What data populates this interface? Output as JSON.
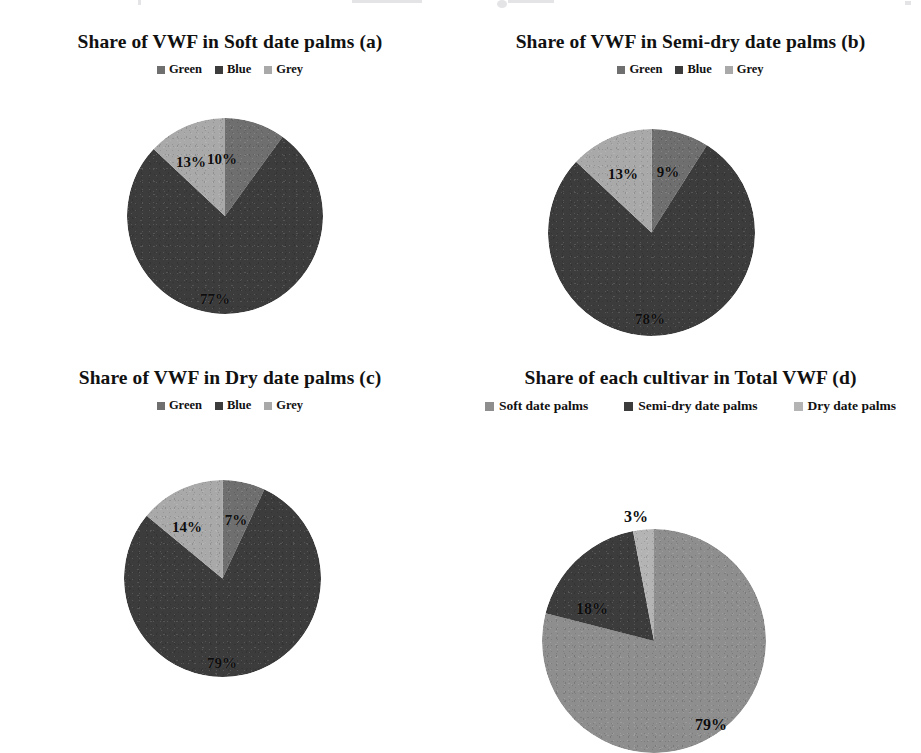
{
  "page": {
    "background_color": "#ffffff",
    "figure_kind": "four-panel pie chart figure (scanned)"
  },
  "palette": {
    "green": "#6f6f6f",
    "blue": "#3c3c3c",
    "grey": "#a9a9a9",
    "soft_date_palms": "#8e8e8e",
    "semi_dry_date_palms": "#3c3c3c",
    "dry_date_palms": "#b4b4b4",
    "label_color": "#0d0d0d"
  },
  "panels": [
    {
      "id": "a",
      "title": "Share of  VWF in Soft date palms (a)",
      "legend": [
        {
          "label": "Green",
          "color": "#6f6f6f"
        },
        {
          "label": "Blue",
          "color": "#3c3c3c"
        },
        {
          "label": "Grey",
          "color": "#a9a9a9"
        }
      ],
      "labels": {
        "green": "10%",
        "blue": "77%",
        "grey": "13%"
      }
    },
    {
      "id": "b",
      "title": "Share of  VWF in Semi-dry date palms (b)",
      "legend": [
        {
          "label": "Green",
          "color": "#6f6f6f"
        },
        {
          "label": "Blue",
          "color": "#3c3c3c"
        },
        {
          "label": "Grey",
          "color": "#a9a9a9"
        }
      ],
      "labels": {
        "green": "9%",
        "blue": "78%",
        "grey": "13%"
      }
    },
    {
      "id": "c",
      "title": "Share of  VWF in Dry date palms (c)",
      "legend": [
        {
          "label": "Green",
          "color": "#6f6f6f"
        },
        {
          "label": "Blue",
          "color": "#3c3c3c"
        },
        {
          "label": "Grey",
          "color": "#a9a9a9"
        }
      ],
      "labels": {
        "green": "7%",
        "blue": "79%",
        "grey": "14%"
      }
    },
    {
      "id": "d",
      "title": "Share of  each cultivar in Total VWF (d)",
      "legend": [
        {
          "label": "Soft date palms",
          "color": "#8e8e8e"
        },
        {
          "label": "Semi-dry date palms",
          "color": "#3c3c3c"
        },
        {
          "label": "Dry date palms",
          "color": "#b4b4b4"
        }
      ],
      "labels": {
        "soft": "79%",
        "semi_dry": "18%",
        "dry": "3%"
      }
    }
  ],
  "chart_data": [
    {
      "type": "pie",
      "panel": "a",
      "title": "Share of  VWF in Soft date palms (a)",
      "categories": [
        "Green",
        "Blue",
        "Grey"
      ],
      "values": [
        10,
        77,
        13
      ],
      "value_labels": [
        "10%",
        "77%",
        "13%"
      ],
      "unit": "percent",
      "colors": [
        "#6f6f6f",
        "#3c3c3c",
        "#a9a9a9"
      ],
      "legend_position": "top",
      "start_angle_deg": 0,
      "direction": "clockwise",
      "grid": false
    },
    {
      "type": "pie",
      "panel": "b",
      "title": "Share of  VWF in Semi-dry date palms (b)",
      "categories": [
        "Green",
        "Blue",
        "Grey"
      ],
      "values": [
        9,
        78,
        13
      ],
      "value_labels": [
        "9%",
        "78%",
        "13%"
      ],
      "unit": "percent",
      "colors": [
        "#6f6f6f",
        "#3c3c3c",
        "#a9a9a9"
      ],
      "legend_position": "top",
      "start_angle_deg": 0,
      "direction": "clockwise",
      "grid": false
    },
    {
      "type": "pie",
      "panel": "c",
      "title": "Share of  VWF in Dry date palms (c)",
      "categories": [
        "Green",
        "Blue",
        "Grey"
      ],
      "values": [
        7,
        79,
        14
      ],
      "value_labels": [
        "7%",
        "79%",
        "14%"
      ],
      "unit": "percent",
      "colors": [
        "#6f6f6f",
        "#3c3c3c",
        "#a9a9a9"
      ],
      "legend_position": "top",
      "start_angle_deg": 0,
      "direction": "clockwise",
      "grid": false
    },
    {
      "type": "pie",
      "panel": "d",
      "title": "Share of  each cultivar in Total VWF (d)",
      "categories": [
        "Soft date palms",
        "Semi-dry date palms",
        "Dry date palms"
      ],
      "values": [
        79,
        18,
        3
      ],
      "value_labels": [
        "79%",
        "18%",
        "3%"
      ],
      "unit": "percent",
      "colors": [
        "#8e8e8e",
        "#3c3c3c",
        "#b4b4b4"
      ],
      "legend_position": "top",
      "start_angle_deg": 0,
      "direction": "clockwise",
      "grid": false
    }
  ]
}
